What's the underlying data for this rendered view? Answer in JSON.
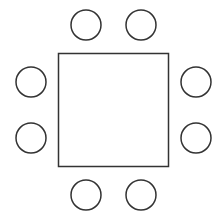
{
  "diagram": {
    "type": "table-seating-layout",
    "stroke_color": "#333333",
    "background": "#ffffff",
    "table": {
      "shape": "square",
      "x": 58.5,
      "y": 53.5,
      "width": 110,
      "height": 113
    },
    "chairs": [
      {
        "position": "top-left",
        "cx": 86,
        "cy": 25,
        "r": 15
      },
      {
        "position": "top-right",
        "cx": 141,
        "cy": 25,
        "r": 15
      },
      {
        "position": "left-top",
        "cx": 31,
        "cy": 82,
        "r": 15
      },
      {
        "position": "left-bottom",
        "cx": 31,
        "cy": 138,
        "r": 15
      },
      {
        "position": "right-top",
        "cx": 196,
        "cy": 82,
        "r": 15
      },
      {
        "position": "right-bottom",
        "cx": 196,
        "cy": 138,
        "r": 15
      },
      {
        "position": "bottom-left",
        "cx": 86,
        "cy": 195,
        "r": 15
      },
      {
        "position": "bottom-right",
        "cx": 141,
        "cy": 195,
        "r": 15
      }
    ]
  }
}
